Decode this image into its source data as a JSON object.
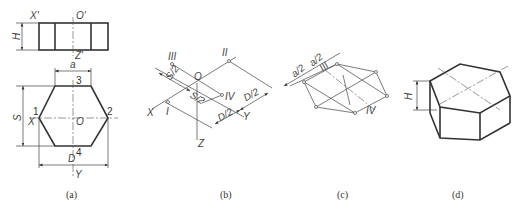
{
  "figure": {
    "panels": [
      {
        "caption": "(a)",
        "labels": {
          "x_prime": "X'",
          "o_prime": "O'",
          "z_prime": "Z'",
          "h": "H",
          "a": "a",
          "s": "S",
          "d": "D",
          "x": "X",
          "o": "O",
          "y": "Y",
          "p1": "1",
          "p2": "2",
          "p3": "3",
          "p4": "4"
        }
      },
      {
        "caption": "(b)",
        "labels": {
          "iii1": "III",
          "sub1": "1",
          "ii1": "II",
          "o1": "O",
          "iv1": "IV",
          "i1": "I",
          "x1": "X",
          "y1": "Y",
          "z1": "Z",
          "s2a": "S/2",
          "s2b": "S/2",
          "d2a": "D/2",
          "d2b": "D/2"
        }
      },
      {
        "caption": "(c)",
        "labels": {
          "a2a": "a/2",
          "a2b": "a/2",
          "iii1": "III",
          "iv1": "IV",
          "sub1": "1"
        }
      },
      {
        "caption": "(d)",
        "labels": {
          "h": "H"
        }
      }
    ]
  }
}
